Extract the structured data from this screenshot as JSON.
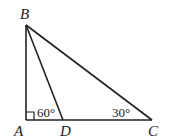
{
  "diagram": {
    "type": "right-triangle",
    "points": {
      "A": {
        "label": "A",
        "x": 26,
        "y": 120
      },
      "B": {
        "label": "B",
        "x": 26,
        "y": 25
      },
      "C": {
        "label": "C",
        "x": 152,
        "y": 120
      },
      "D": {
        "label": "D",
        "x": 63,
        "y": 120
      }
    },
    "segments": [
      "AB",
      "BC",
      "AC",
      "BD"
    ],
    "angles": [
      {
        "at": "A",
        "mark": "right-angle"
      },
      {
        "at": "D",
        "label": "60°",
        "value": 60
      },
      {
        "at": "C",
        "label": "30°",
        "value": 30
      }
    ]
  }
}
